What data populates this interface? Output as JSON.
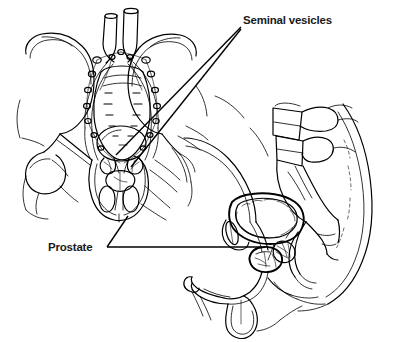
{
  "figure": {
    "background_color": "#ffffff",
    "ink_color": "#000000",
    "style": "black and white line drawing",
    "width": 407,
    "height": 342
  },
  "labels": [
    {
      "id": "seminal-vesicles",
      "text": "Seminal vesicles",
      "x": 243,
      "y": 24,
      "leader_color": "#000000"
    },
    {
      "id": "prostate",
      "text": "Prostate",
      "x": 48,
      "y": 251,
      "leader_color": "#000000"
    }
  ],
  "views": [
    {
      "id": "anterior-pelvis",
      "name": "Anterior view of male pelvis",
      "structures": [
        "iliac crest left",
        "iliac crest right",
        "sacrum",
        "sacral foramina",
        "pubic symphysis",
        "obturator foramen left",
        "obturator foramen right",
        "femoral head left",
        "femoral head right",
        "abdominal aorta",
        "inferior vena cava",
        "common iliac vessels",
        "pelvic lymph nodes",
        "bladder",
        "prostate",
        "seminal vesicles"
      ]
    },
    {
      "id": "sagittal-pelvis",
      "name": "Midsagittal view of male pelvis",
      "structures": [
        "lumbar vertebrae",
        "sacrum",
        "coccyx",
        "pubic bone",
        "bladder",
        "prostate",
        "seminal vesicle",
        "rectum",
        "urethra",
        "penis",
        "scrotum",
        "testis",
        "buttock contour",
        "abdominal wall"
      ]
    }
  ]
}
